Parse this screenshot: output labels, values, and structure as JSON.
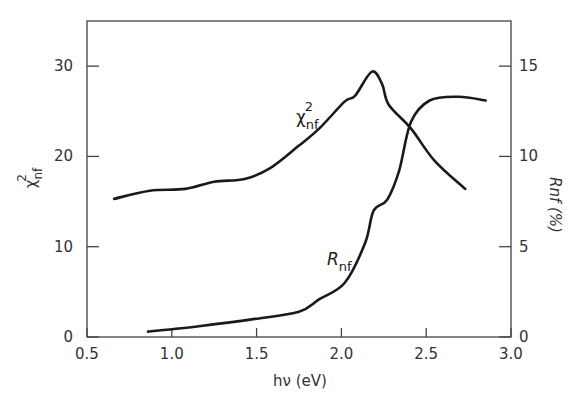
{
  "chart_data": {
    "type": "line",
    "title": "",
    "xlabel": "hν (eV)",
    "ylabel_left": "χ²nf",
    "ylabel_right": "Rnf (%)",
    "xlim": [
      0.5,
      3.0
    ],
    "ylim_left": [
      0,
      35
    ],
    "ylim_right": [
      0,
      17.5
    ],
    "x_ticks": [
      "0.5",
      "1.0",
      "1.5",
      "2.0",
      "2.5",
      "3.0"
    ],
    "y_left_ticks": [
      "0",
      "10",
      "20",
      "30"
    ],
    "y_right_ticks": [
      "0",
      "5",
      "10",
      "15"
    ],
    "grid": false,
    "legend": "inline curve labels",
    "series": [
      {
        "name": "χ²nf",
        "axis": "left",
        "label_main": "χ",
        "label_sup": "2",
        "label_sub": "nf",
        "x": [
          0.66,
          0.87,
          1.08,
          1.25,
          1.43,
          1.58,
          1.75,
          1.87,
          2.02,
          2.08,
          2.18,
          2.24,
          2.28,
          2.41,
          2.55,
          2.73
        ],
        "values": [
          15.3,
          16.2,
          16.4,
          17.2,
          17.5,
          18.7,
          21.2,
          23.1,
          26.1,
          26.7,
          29.4,
          28.0,
          25.7,
          23.1,
          19.5,
          16.4
        ]
      },
      {
        "name": "Rnf",
        "axis": "right",
        "label_main": "R",
        "label_sub": "nf",
        "x": [
          0.86,
          1.16,
          1.49,
          1.75,
          1.87,
          2.02,
          2.14,
          2.19,
          2.27,
          2.34,
          2.41,
          2.52,
          2.69,
          2.85
        ],
        "values": [
          0.3,
          0.6,
          1.0,
          1.4,
          2.1,
          3.0,
          5.2,
          7.0,
          7.6,
          9.2,
          11.9,
          13.1,
          13.3,
          13.1
        ]
      }
    ]
  }
}
